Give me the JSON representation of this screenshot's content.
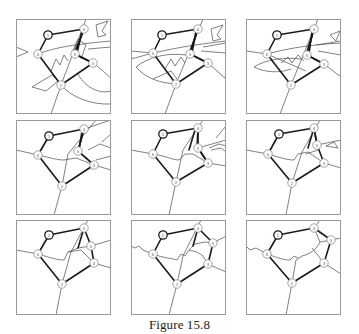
{
  "figure": {
    "caption": "Figure 15.8",
    "grid": {
      "rows": 3,
      "cols": 3,
      "panel_size": 95,
      "col_x": [
        16,
        131,
        246
      ],
      "row_y": [
        19,
        120,
        220
      ]
    },
    "colors": {
      "frame": "#9a9a9a",
      "edge": "#1a1a1a",
      "region": "#4a4a4a",
      "node_fill": "#ffffff"
    },
    "node_labels": [
      "1",
      "2",
      "3",
      "4",
      "5",
      "6"
    ],
    "graph_edges": [
      [
        "1",
        "4"
      ],
      [
        "4",
        "5"
      ],
      [
        "5",
        "3"
      ],
      [
        "3",
        "2"
      ],
      [
        "2",
        "6"
      ],
      [
        "6",
        "1"
      ]
    ],
    "panels": [
      {
        "id": 1,
        "nodes": {
          "1": [
            32,
            16
          ],
          "2": [
            45,
            66
          ],
          "3": [
            77,
            44
          ],
          "4": [
            68,
            10
          ],
          "5": [
            59,
            35
          ],
          "6": [
            22,
            35
          ]
        },
        "extra_edges": [
          [
            [
              68,
              10
            ],
            [
              58,
              35
            ]
          ],
          [
            [
              66,
              12
            ],
            [
              61,
              34
            ]
          ],
          [
            [
              59,
              35
            ],
            [
              77,
              44
            ]
          ]
        ],
        "regions": [
          "M70,0 L45,66 L35,95",
          "M0,28 L12,33 L0,38",
          "M22,35 C40,28 62,25 95,22",
          "M35,52 L40,40 L44,46 L48,36 L52,42",
          "M16,68 L36,56 L42,62 L30,72 Z",
          "M77,44 C85,50 92,56 95,60",
          "M62,55 C70,70 85,75 95,72",
          "M55,36 L62,20 L70,26 L65,40",
          "M80,6 L92,2 L86,12 L90,16 L82,18 Z",
          "M72,30 L95,28",
          "M45,66 C55,78 75,86 95,85"
        ]
      },
      {
        "id": 2,
        "nodes": {
          "1": [
            31,
            16
          ],
          "2": [
            45,
            65
          ],
          "3": [
            77,
            44
          ],
          "4": [
            67,
            10
          ],
          "5": [
            59,
            35
          ],
          "6": [
            22,
            34
          ]
        },
        "extra_edges": [
          [
            [
              67,
              10
            ],
            [
              58,
              35
            ]
          ],
          [
            [
              65,
              12
            ],
            [
              61,
              34
            ]
          ],
          [
            [
              59,
              35
            ],
            [
              77,
              44
            ]
          ]
        ],
        "regions": [
          "M72,0 L45,65 L34,95",
          "M0,32 L22,34 L0,40",
          "M22,34 C40,30 60,26 95,22",
          "M5,48 C20,36 40,34 55,36",
          "M5,48 C15,60 30,64 45,65",
          "M34,50 L40,40 L44,47 L50,38 L54,44",
          "M22,60 L40,52 L46,60",
          "M77,44 L95,60",
          "M70,32 L95,34",
          "M80,10 L92,6 L86,16 L90,20 L82,22 Z",
          "M72,28 L95,24"
        ]
      },
      {
        "id": 3,
        "nodes": {
          "1": [
            31,
            16
          ],
          "2": [
            45,
            66
          ],
          "3": [
            78,
            45
          ],
          "4": [
            68,
            10
          ],
          "5": [
            61,
            36
          ],
          "6": [
            21,
            35
          ]
        },
        "extra_edges": [
          [
            [
              68,
              10
            ],
            [
              60,
              36
            ]
          ],
          [
            [
              66,
              12
            ],
            [
              63,
              35
            ]
          ],
          [
            [
              61,
              36
            ],
            [
              78,
              45
            ]
          ]
        ],
        "regions": [
          "M72,0 L45,66 L34,95",
          "M0,32 L21,35",
          "M21,35 C40,30 60,26 95,24",
          "M8,48 C20,40 40,38 55,40",
          "M8,48 C20,54 34,54 45,50",
          "M35,44 L42,38 L46,44 L52,36 L58,42",
          "M21,35 L60,52",
          "M78,45 L95,58",
          "M72,32 L95,36",
          "M84,16 L94,12 L90,22 Z",
          "M70,26 L95,22"
        ]
      },
      {
        "id": 4,
        "nodes": {
          "1": [
            33,
            16
          ],
          "2": [
            46,
            66
          ],
          "3": [
            78,
            45
          ],
          "4": [
            68,
            9
          ],
          "5": [
            62,
            31
          ],
          "6": [
            22,
            35
          ]
        },
        "extra_edges": [
          [
            [
              68,
              9
            ],
            [
              62,
              31
            ]
          ],
          [
            [
              66,
              11
            ],
            [
              63,
              30
            ]
          ],
          [
            [
              62,
              31
            ],
            [
              78,
              45
            ]
          ]
        ],
        "regions": [
          "M80,0 L52,34 L46,66 L38,95",
          "M0,30 L22,35 C35,38 42,40 48,40",
          "M48,40 L60,38 L78,45",
          "M78,45 L95,50",
          "M68,9 L95,0",
          "M72,30 L84,24 L95,28",
          "M80,40 L95,36",
          "M86,22 L95,14"
        ]
      },
      {
        "id": 5,
        "nodes": {
          "1": [
            32,
            14
          ],
          "2": [
            45,
            62
          ],
          "3": [
            77,
            43
          ],
          "4": [
            67,
            8
          ],
          "5": [
            67,
            28
          ],
          "6": [
            22,
            34
          ]
        },
        "extra_edges": [
          [
            [
              67,
              8
            ],
            [
              66,
              28
            ]
          ],
          [
            [
              64,
              10
            ],
            [
              58,
              30
            ]
          ],
          [
            [
              67,
              28
            ],
            [
              77,
              43
            ]
          ]
        ],
        "regions": [
          "M72,0 L52,30 L45,62 L38,95",
          "M0,30 L22,34 C35,36 42,40 48,40",
          "M48,40 L54,34 L62,34 L77,43",
          "M77,43 L95,46",
          "M67,28 L95,20",
          "M78,28 L88,24 L95,26",
          "M80,30 L90,28 L95,32",
          "M85,18 L95,6"
        ]
      },
      {
        "id": 6,
        "nodes": {
          "1": [
            33,
            14
          ],
          "2": [
            46,
            63
          ],
          "3": [
            78,
            43
          ],
          "4": [
            68,
            8
          ],
          "5": [
            71,
            25
          ],
          "6": [
            22,
            34
          ]
        },
        "extra_edges": [
          [
            [
              68,
              8
            ],
            [
              62,
              28
            ]
          ],
          [
            [
              68,
              8
            ],
            [
              71,
              25
            ]
          ]
        ],
        "regions": [
          "M74,0 L56,32 L46,63 L40,95",
          "M0,30 L22,34 C35,38 42,40 48,40",
          "M48,40 L52,34 L62,32 L78,43",
          "M78,43 L95,48",
          "M71,25 L95,20",
          "M80,26 L88,22 L92,28 Z",
          "M60,34 L72,30"
        ]
      },
      {
        "id": 7,
        "nodes": {
          "1": [
            33,
            15
          ],
          "2": [
            46,
            64
          ],
          "3": [
            78,
            43
          ],
          "4": [
            68,
            8
          ],
          "5": [
            75,
            26
          ],
          "6": [
            22,
            34
          ]
        },
        "extra_edges": [
          [
            [
              68,
              8
            ],
            [
              62,
              28
            ]
          ]
        ],
        "regions": [
          "M72,0 L55,32 L46,64 L40,95",
          "M0,30 L22,34 C35,38 42,40 48,40",
          "M48,40 L52,32 L65,30 L78,43",
          "M78,43 L95,48",
          "M75,26 L95,20",
          "M52,32 L62,28 L75,26"
        ]
      },
      {
        "id": 8,
        "nodes": {
          "1": [
            32,
            15
          ],
          "2": [
            46,
            64
          ],
          "3": [
            77,
            44
          ],
          "4": [
            67,
            8
          ],
          "5": [
            82,
            23
          ],
          "6": [
            22,
            34
          ]
        },
        "extra_edges": [
          [
            [
              67,
              8
            ],
            [
              62,
              26
            ]
          ]
        ],
        "regions": [
          "M70,0 L52,36 L46,64 L38,95",
          "M0,26 L4,28 L8,26 L12,30 L22,34",
          "M22,34 C32,38 40,38 46,40 L50,34 L54,36 L58,30 L66,32 L72,36 L77,44",
          "M77,44 L95,52",
          "M82,23 L95,16",
          "M58,30 L64,24 L74,22 L82,23"
        ]
      },
      {
        "id": 9,
        "nodes": {
          "1": [
            32,
            15
          ],
          "2": [
            46,
            63
          ],
          "3": [
            78,
            43
          ],
          "4": [
            68,
            8
          ],
          "5": [
            85,
            20
          ],
          "6": [
            21,
            34
          ]
        },
        "extra_edges": [],
        "regions": [
          "M74,0 L68,8",
          "M85,20 L95,18",
          "M0,26 L4,30 L10,28 L21,34",
          "M21,34 C32,38 38,40 44,40 L48,36 L52,38",
          "M46,63 L50,40 L56,36 C64,34 70,30 74,22 L85,20",
          "M74,22 L68,8",
          "M66,28 L78,43",
          "M78,43 L95,54",
          "M46,63 L40,95"
        ]
      }
    ]
  }
}
